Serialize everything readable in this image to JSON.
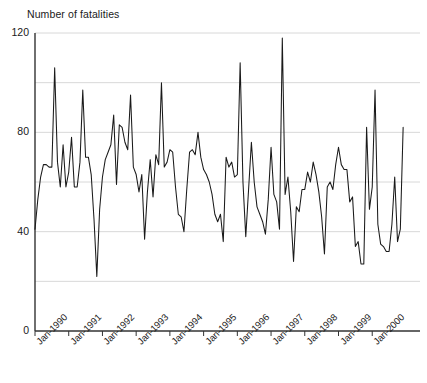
{
  "chart_data": {
    "type": "line",
    "title": "Number of fatalities",
    "xlabel": "",
    "ylabel": "Number of fatalities",
    "ylim": [
      0,
      120
    ],
    "yticks": [
      0,
      40,
      80,
      120
    ],
    "ytick_labels": [
      "0",
      "40",
      "80",
      "120"
    ],
    "gridlines": [
      20,
      40,
      60,
      80,
      100,
      120
    ],
    "grid": true,
    "legend": null,
    "line_color": "#1a1a1a",
    "grid_color": "#d8d8d8",
    "axis_color": "#333333",
    "xtick_labels": [
      "Jan-1990",
      "Jan-1991",
      "Jan-1992",
      "Jan-1993",
      "Jan-1994",
      "Jan-1995",
      "Jan-1996",
      "Jan-1997",
      "Jan-1998",
      "Jan-1999",
      "Jan-2000"
    ],
    "xtick_interval_points": 12,
    "x_start": "Jan-1990",
    "x_end": "Nov-2000",
    "values": [
      41,
      53,
      62,
      67,
      67,
      66,
      66,
      106,
      68,
      58,
      75,
      58,
      64,
      78,
      58,
      58,
      68,
      97,
      70,
      70,
      63,
      45,
      22,
      49,
      62,
      69,
      72,
      75,
      87,
      59,
      83,
      82,
      76,
      73,
      95,
      66,
      63,
      56,
      63,
      37,
      56,
      69,
      54,
      71,
      67,
      100,
      66,
      68,
      73,
      72,
      58,
      47,
      46,
      40,
      57,
      72,
      73,
      71,
      80,
      70,
      65,
      63,
      60,
      55,
      47,
      44,
      47,
      36,
      70,
      66,
      68,
      62,
      63,
      108,
      60,
      38,
      57,
      76,
      60,
      50,
      47,
      44,
      39,
      53,
      74,
      55,
      52,
      41,
      118,
      55,
      62,
      48,
      28,
      50,
      48,
      57,
      57,
      64,
      60,
      68,
      63,
      56,
      46,
      31,
      58,
      60,
      57,
      67,
      74,
      67,
      65,
      65,
      52,
      54,
      34,
      36,
      27,
      27,
      82,
      49,
      58,
      97,
      43,
      35,
      34,
      32,
      32,
      43,
      62,
      36,
      41,
      82
    ]
  }
}
